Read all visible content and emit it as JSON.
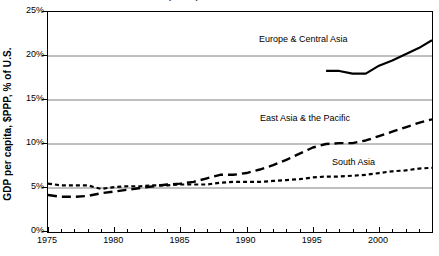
{
  "title_sliver": "GDP per capita relative to the U.S.",
  "axes": {
    "y_axis_title": "GDP per capita, $PPP, % of U.S.",
    "y_ticks": [
      "0%",
      "5%",
      "10%",
      "15%",
      "20%",
      "25%"
    ],
    "x_ticks": [
      "1975",
      "1980",
      "1985",
      "1990",
      "1995",
      "2000"
    ]
  },
  "annotations": {
    "europe": "Europe & Central Asia",
    "east_asia": "East Asia & the Pacific",
    "south_asia": "South Asia"
  },
  "chart_data": {
    "type": "line",
    "title": "GDP per capita relative to the U.S.",
    "xlabel": "",
    "ylabel": "GDP per capita, $PPP, % of U.S.",
    "xlim": [
      1975,
      2004
    ],
    "ylim": [
      0,
      25
    ],
    "y_tick_values": [
      0,
      5,
      10,
      15,
      20,
      25
    ],
    "y_tick_labels": [
      "0%",
      "5%",
      "10%",
      "15%",
      "20%",
      "25%"
    ],
    "x_tick_values": [
      1975,
      1980,
      1985,
      1990,
      1995,
      2000
    ],
    "x_minor_tick_interval": 1,
    "grid": "horizontal",
    "legend_position": "inline-annotations",
    "units": "percent of U.S. GDP per capita, $PPP",
    "series": [
      {
        "name": "Europe & Central Asia",
        "style": "solid",
        "color": "#000000",
        "x": [
          1996,
          1997,
          1998,
          1999,
          2000,
          2001,
          2002,
          2003,
          2004
        ],
        "values": [
          18.3,
          18.3,
          18.0,
          18.0,
          18.9,
          19.5,
          20.2,
          20.9,
          21.8
        ]
      },
      {
        "name": "East Asia & the Pacific",
        "style": "long-dash",
        "color": "#000000",
        "x": [
          1975,
          1976,
          1977,
          1978,
          1979,
          1980,
          1981,
          1982,
          1983,
          1984,
          1985,
          1986,
          1987,
          1988,
          1989,
          1990,
          1991,
          1992,
          1993,
          1994,
          1995,
          1996,
          1997,
          1998,
          1999,
          2000,
          2001,
          2002,
          2003,
          2004
        ],
        "values": [
          4.2,
          4.0,
          4.0,
          4.1,
          4.4,
          4.6,
          4.8,
          5.0,
          5.2,
          5.4,
          5.5,
          5.7,
          6.1,
          6.5,
          6.5,
          6.7,
          7.1,
          7.6,
          8.2,
          8.9,
          9.6,
          10.0,
          10.1,
          10.1,
          10.4,
          10.9,
          11.4,
          11.9,
          12.4,
          12.8
        ]
      },
      {
        "name": "South Asia",
        "style": "short-dash",
        "color": "#000000",
        "x": [
          1975,
          1976,
          1977,
          1978,
          1979,
          1980,
          1981,
          1982,
          1983,
          1984,
          1985,
          1986,
          1987,
          1988,
          1989,
          1990,
          1991,
          1992,
          1993,
          1994,
          1995,
          1996,
          1997,
          1998,
          1999,
          2000,
          2001,
          2002,
          2003,
          2004
        ],
        "values": [
          5.5,
          5.3,
          5.3,
          5.3,
          4.9,
          5.1,
          5.2,
          5.2,
          5.3,
          5.3,
          5.4,
          5.4,
          5.4,
          5.6,
          5.7,
          5.7,
          5.7,
          5.8,
          5.9,
          6.0,
          6.2,
          6.3,
          6.3,
          6.4,
          6.5,
          6.7,
          6.9,
          7.0,
          7.2,
          7.3
        ]
      }
    ]
  }
}
